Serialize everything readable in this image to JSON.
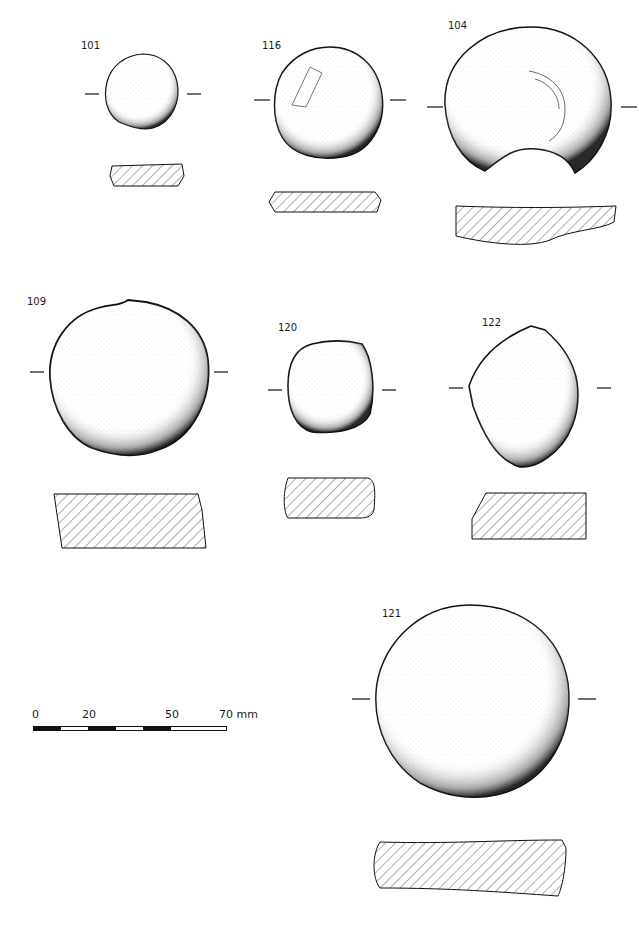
{
  "plate": {
    "objects": [
      {
        "id": "101",
        "label": "101"
      },
      {
        "id": "116",
        "label": "116"
      },
      {
        "id": "104",
        "label": "104"
      },
      {
        "id": "109",
        "label": "109"
      },
      {
        "id": "120",
        "label": "120"
      },
      {
        "id": "122",
        "label": "122"
      },
      {
        "id": "121",
        "label": "121"
      }
    ]
  },
  "scale_bar": {
    "ticks": [
      "0",
      "20",
      "50",
      "70 mm"
    ],
    "unit": "mm",
    "max": 70,
    "segments": [
      "black",
      "white",
      "black",
      "white",
      "black",
      "white"
    ]
  },
  "colors": {
    "ink": "#111111",
    "paper": "#ffffff",
    "stipple": "#bdbdbd"
  }
}
